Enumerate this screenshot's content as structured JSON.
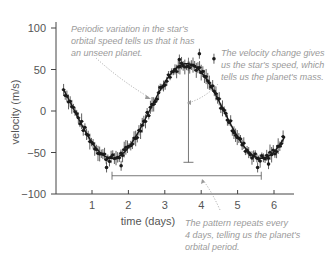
{
  "chart_data": {
    "type": "scatter",
    "title": "",
    "xlabel": "time (days)",
    "ylabel": "velocity (m/s)",
    "xlim": [
      0,
      6.5
    ],
    "ylim": [
      -100,
      120
    ],
    "xticks": [
      1,
      2,
      3,
      4,
      5,
      6
    ],
    "yticks": [
      100,
      50,
      0,
      -50,
      -100
    ],
    "xtick_labels": [
      "1",
      "2",
      "3",
      "4",
      "5",
      "6"
    ],
    "ytick_labels": [
      "100",
      "50",
      "0",
      "−50",
      "−100"
    ],
    "grid": false,
    "legend": null,
    "series": [
      {
        "name": "radial velocity measurements",
        "model": "sinusoid",
        "amplitude": 57,
        "period_days": 4.1,
        "phase_peak_day": 3.6,
        "x": [
          0.2,
          0.35,
          0.5,
          0.65,
          0.8,
          0.95,
          1.1,
          1.25,
          1.4,
          1.5,
          1.6,
          1.75,
          1.9,
          2.05,
          2.2,
          2.35,
          2.5,
          2.65,
          2.8,
          2.95,
          3.1,
          3.25,
          3.4,
          3.55,
          3.7,
          3.85,
          4.0,
          4.15,
          4.3,
          4.45,
          4.6,
          4.75,
          4.9,
          5.05,
          5.2,
          5.35,
          5.5,
          5.65,
          5.8,
          5.95,
          6.1,
          6.25
        ],
        "y": [
          36,
          25,
          14,
          3,
          -10,
          -22,
          -35,
          -45,
          -52,
          -57,
          -55,
          -52,
          -45,
          -36,
          -25,
          -13,
          -1,
          10,
          22,
          33,
          42,
          50,
          55,
          57,
          56,
          52,
          47,
          38,
          28,
          17,
          5,
          -8,
          -19,
          -31,
          -41,
          -49,
          -54,
          -57,
          -52,
          -46,
          -36,
          -25
        ]
      }
    ],
    "annotations": [
      {
        "id": "periodic",
        "text": [
          "Periodic variation in the star's",
          "orbital speed tells us that it has",
          "an unseen planet."
        ],
        "arrow_to": [
          2.8,
          22
        ]
      },
      {
        "id": "velocity",
        "text": [
          "The velocity change gives",
          "us the star's speed, which",
          "tells us the planet's mass."
        ],
        "arrow_to": [
          3.65,
          3
        ]
      },
      {
        "id": "period",
        "text": [
          "The pattern repeats every",
          "4 days, telling us the planet's",
          "orbital period."
        ],
        "arrow_to": [
          4.0,
          -77
        ]
      }
    ],
    "measure_bars": [
      {
        "type": "vertical",
        "x": 3.65,
        "y_from": 57,
        "y_to": -57,
        "label": "amplitude"
      },
      {
        "type": "horizontal",
        "y": -78,
        "x_from": 1.55,
        "x_to": 5.65,
        "label": "period"
      }
    ]
  },
  "colors": {
    "axis": "#444444",
    "data": "#1a1a1a",
    "annotation": "#9a9a9a",
    "bars": "#555555"
  }
}
